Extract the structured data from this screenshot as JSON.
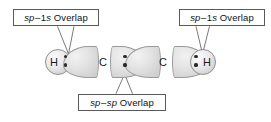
{
  "figure": {
    "background_color": "#ffffff"
  },
  "callouts": [
    {
      "id": "left",
      "name": "callout-sp-1s-left",
      "text": "sp–1s Overlap",
      "parts": {
        "orbital_a": "sp",
        "dash": "–",
        "orbital_b": "1s",
        "word": "Overlap"
      },
      "points_to": "left C–H sigma bond"
    },
    {
      "id": "right",
      "name": "callout-sp-1s-right",
      "text": "sp–1s Overlap",
      "parts": {
        "orbital_a": "sp",
        "dash": "–",
        "orbital_b": "1s",
        "word": "Overlap"
      },
      "points_to": "right C–H sigma bond"
    },
    {
      "id": "bottom",
      "name": "callout-sp-sp",
      "text": "sp–sp Overlap",
      "parts": {
        "orbital_a": "sp",
        "dash": "–",
        "orbital_b": "sp",
        "word": "Overlap"
      },
      "points_to": "central C–C sigma bond"
    }
  ],
  "molecule": {
    "formula_atoms": [
      "H",
      "C",
      "C",
      "H"
    ],
    "atoms": [
      {
        "label": "H",
        "kind": "hydrogen-1s-sphere"
      },
      {
        "label": "C",
        "kind": "carbon-letter"
      },
      {
        "label": "C",
        "kind": "carbon-letter"
      },
      {
        "label": "H",
        "kind": "hydrogen-1s-sphere"
      }
    ],
    "bonds": [
      {
        "name": "bond-h-c-left",
        "type": "sp–1s",
        "electron_dots": 2
      },
      {
        "name": "bond-c-c",
        "type": "sp–sp",
        "electron_dots": 2
      },
      {
        "name": "bond-h-c-right",
        "type": "sp–1s",
        "electron_dots": 2
      }
    ],
    "lobes": 4,
    "electron_pair_dots_per_bond": 2
  },
  "colors": {
    "box_border": "#5a5a5a",
    "lobe_fill_light": "#f2f2f2",
    "lobe_fill_dark": "#c9c9c9",
    "lobe_border": "#9a9a9a",
    "dot": "#2b2b2b",
    "text": "#111111",
    "leader_line": "#6b6b6b"
  }
}
